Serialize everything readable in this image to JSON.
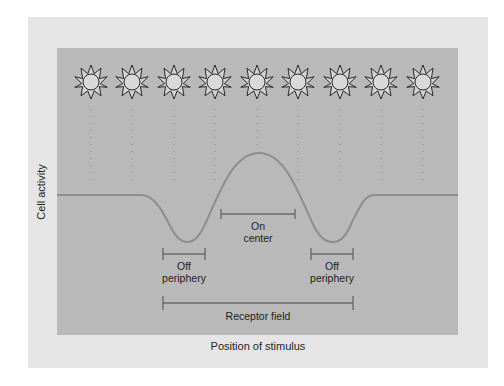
{
  "figure": {
    "y_axis_label": "Cell activity",
    "x_axis_label": "Position of stimulus",
    "stimulus_icon": "sun-icon",
    "stimulus_count": 9,
    "annotations": {
      "on_center_line1": "On",
      "on_center_line2": "center",
      "off_left_line1": "Off",
      "off_left_line2": "periphery",
      "off_right_line1": "Off",
      "off_right_line2": "periphery",
      "receptor_field": "Receptor field"
    },
    "colors": {
      "page_background": "#ffffff",
      "outer_panel": "#e5e5e5",
      "inner_panel": "#b9b9b9",
      "curve": "#8f8f8f",
      "bracket": "#6e6e6e",
      "sun_fill": "#d9d9d9",
      "sun_stroke": "#2a2a2a"
    }
  }
}
